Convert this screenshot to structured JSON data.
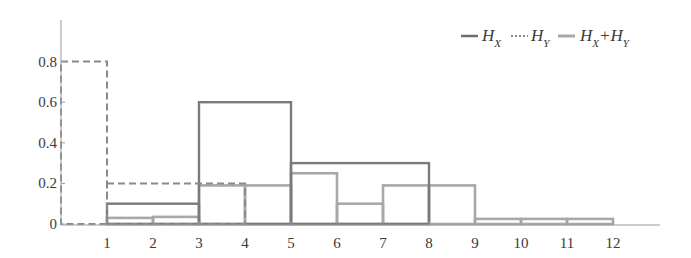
{
  "chart_data": {
    "type": "bar",
    "subtype": "step-histogram",
    "title": "",
    "xlabel": "",
    "ylabel": "",
    "xlim": [
      0,
      13
    ],
    "ylim": [
      0,
      1.0
    ],
    "grid": false,
    "legend_position": "top-right",
    "x_ticks": [
      "1",
      "2",
      "3",
      "4",
      "5",
      "6",
      "7",
      "8",
      "9",
      "10",
      "11",
      "12"
    ],
    "y_ticks": [
      "0",
      "0.2",
      "0.4",
      "0.6",
      "0.8"
    ],
    "series": [
      {
        "name": "H_X",
        "label_main": "H",
        "label_sub": "X",
        "style": "solid-dark",
        "color": "#7a7a7a",
        "bins": [
          {
            "x0": 1,
            "x1": 3,
            "value": 0.1
          },
          {
            "x0": 3,
            "x1": 5,
            "value": 0.6
          },
          {
            "x0": 5,
            "x1": 8,
            "value": 0.3
          }
        ]
      },
      {
        "name": "H_Y",
        "label_main": "H",
        "label_sub": "Y",
        "style": "dashed",
        "color": "#8a8a8a",
        "bins": [
          {
            "x0": 0,
            "x1": 1,
            "value": 0.8
          },
          {
            "x0": 1,
            "x1": 4,
            "value": 0.2
          }
        ]
      },
      {
        "name": "H_X+H_Y",
        "label_main": "H",
        "label_sub": "X",
        "label_plus": "+H",
        "label_sub2": "Y",
        "style": "solid-light",
        "color": "#a8a8a8",
        "bins": [
          {
            "x0": 1,
            "x1": 2,
            "value": 0.03
          },
          {
            "x0": 2,
            "x1": 3,
            "value": 0.035
          },
          {
            "x0": 3,
            "x1": 4,
            "value": 0.19
          },
          {
            "x0": 4,
            "x1": 5,
            "value": 0.19
          },
          {
            "x0": 5,
            "x1": 6,
            "value": 0.25
          },
          {
            "x0": 6,
            "x1": 7,
            "value": 0.1
          },
          {
            "x0": 7,
            "x1": 8,
            "value": 0.19
          },
          {
            "x0": 8,
            "x1": 9,
            "value": 0.19
          },
          {
            "x0": 9,
            "x1": 10,
            "value": 0.025
          },
          {
            "x0": 10,
            "x1": 11,
            "value": 0.025
          },
          {
            "x0": 11,
            "x1": 12,
            "value": 0.025
          }
        ]
      }
    ]
  },
  "legend": {
    "hx_main": "H",
    "hx_sub": "X",
    "hy_main": "H",
    "hy_sub": "Y",
    "sum_main1": "H",
    "sum_sub1": "X",
    "sum_plus": "+H",
    "sum_sub2": "Y"
  }
}
